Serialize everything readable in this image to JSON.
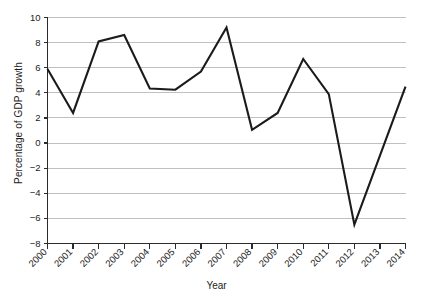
{
  "chart_data": {
    "type": "line",
    "title": "",
    "xlabel": "Year",
    "ylabel": "Percentage of GDP growth",
    "categories": [
      "2000",
      "2001",
      "2002",
      "2003",
      "2004",
      "2005",
      "2006",
      "2007",
      "2008",
      "2009",
      "2010",
      "2011",
      "2012",
      "2013",
      "2014"
    ],
    "x": [
      2000,
      2001,
      2002,
      2003,
      2004,
      2005,
      2006,
      2007,
      2008,
      2009,
      2010,
      2011,
      2012,
      2013,
      2014
    ],
    "values": [
      5.9,
      2.4,
      8.1,
      8.6,
      4.35,
      4.25,
      5.7,
      9.2,
      1.05,
      2.4,
      6.7,
      3.9,
      -6.5,
      -1.0,
      4.5
    ],
    "series": [
      {
        "name": "GDP growth",
        "values": [
          5.9,
          2.4,
          8.1,
          8.6,
          4.35,
          4.25,
          5.7,
          9.2,
          1.05,
          2.4,
          6.7,
          3.9,
          -6.5,
          -1.0,
          4.5
        ]
      }
    ],
    "ylim": [
      -8,
      10
    ],
    "yticks": [
      -8,
      -6,
      -4,
      -2,
      0,
      2,
      4,
      6,
      8,
      10
    ],
    "ytick_labels": [
      "−8",
      "−6",
      "−4",
      "−2",
      "0",
      "2",
      "4",
      "6",
      "8",
      "10"
    ],
    "xlim": [
      2000,
      2014
    ],
    "grid": "horizontal",
    "legend": "none",
    "line_color": "#1b1b1b",
    "grid_color": "#b9b9b9",
    "axis_color": "#2b2b2b",
    "background_color": "#ffffff",
    "xtick_label_rotation": -45
  }
}
